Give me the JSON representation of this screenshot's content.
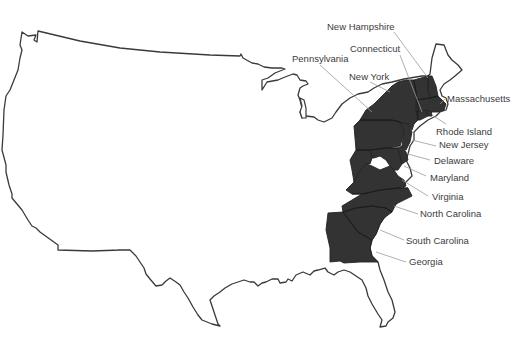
{
  "map": {
    "title": "",
    "subject": "Thirteen Colonies on United States outline",
    "colors": {
      "colony_fill": "#333333",
      "outline_stroke": "#3a3a3a",
      "label_text": "#3c3c3c",
      "leader_line": "#9a9a9a",
      "background": "#ffffff"
    },
    "labels": [
      {
        "id": "new-hampshire",
        "text": "New Hampshire"
      },
      {
        "id": "connecticut",
        "text": "Connecticut"
      },
      {
        "id": "pennsylvania",
        "text": "Pennsylvania"
      },
      {
        "id": "new-york",
        "text": "New York"
      },
      {
        "id": "massachusetts",
        "text": "Massachusetts"
      },
      {
        "id": "rhode-island",
        "text": "Rhode Island"
      },
      {
        "id": "new-jersey",
        "text": "New Jersey"
      },
      {
        "id": "delaware",
        "text": "Delaware"
      },
      {
        "id": "maryland",
        "text": "Maryland"
      },
      {
        "id": "virginia",
        "text": "Virginia"
      },
      {
        "id": "north-carolina",
        "text": "North Carolina"
      },
      {
        "id": "south-carolina",
        "text": "South Carolina"
      },
      {
        "id": "georgia",
        "text": "Georgia"
      }
    ]
  }
}
